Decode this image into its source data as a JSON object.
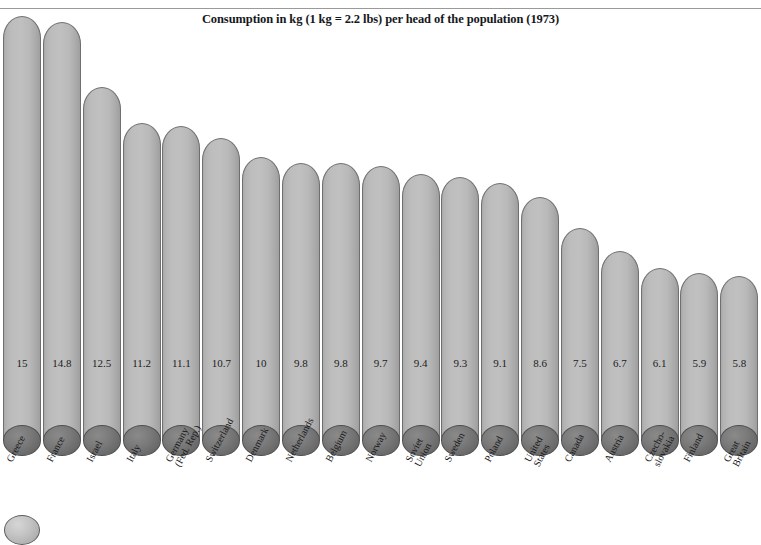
{
  "chart_data": {
    "type": "bar",
    "title": "Consumption in kg (1 kg = 2.2 lbs) per head of the population (1973)",
    "xlabel": "",
    "ylabel": "",
    "ylim": [
      0,
      15
    ],
    "grid": false,
    "legend": "none",
    "orientation": "vertical",
    "style": "cylindrical 3D columns, light grey with dark grey elliptical bases",
    "categories": [
      "Greece",
      "France",
      "Israel",
      "Italy",
      "Germany\n(Fed. Rep.)",
      "Switzerland",
      "Denmark",
      "Netherlands",
      "Belgium",
      "Norway",
      "Soviet\nUnion",
      "Sweden",
      "Poland",
      "United\nStates",
      "Canada",
      "Austria",
      "Czecho-\nslovakia",
      "Finland",
      "Great\nBritain"
    ],
    "values": [
      15,
      14.8,
      12.5,
      11.2,
      11.1,
      10.7,
      10,
      9.8,
      9.8,
      9.7,
      9.4,
      9.3,
      9.1,
      8.6,
      7.5,
      6.7,
      6.1,
      5.9,
      5.8
    ],
    "value_labels": [
      "15",
      "14.8",
      "12.5",
      "11.2",
      "11.1",
      "10.7",
      "10",
      "9.8",
      "9.8",
      "9.7",
      "9.4",
      "9.3",
      "9.1",
      "8.6",
      "7.5",
      "6.7",
      "6.1",
      "5.9",
      "5.8"
    ]
  },
  "colors": {
    "bar_fill": "#bdbdbd",
    "bar_outline": "#6f6f6f",
    "base_fill": "#6a6a6a",
    "title_text": "#16181c",
    "rule": "#9a9a9a",
    "background": "#ffffff"
  }
}
